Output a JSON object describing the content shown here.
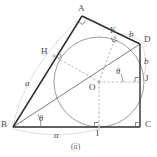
{
  "figure": {
    "caption": "(ii)",
    "colors": {
      "outline_dark": "#2b2b2b",
      "line_medium": "#6b6b6b",
      "line_light": "#9a9a9a",
      "dashed": "#8c8c8c",
      "dotted": "#b0b0b0",
      "circle": "#7d7d7d",
      "background": "#ffffff",
      "label": "#4a4a4a"
    },
    "points": [
      {
        "name": "A",
        "label": "A",
        "x": 82,
        "y": 16,
        "lx": 78,
        "ly": 8
      },
      {
        "name": "B",
        "label": "B",
        "x": 13,
        "y": 127,
        "lx": 2,
        "ly": 122
      },
      {
        "name": "C",
        "label": "C",
        "x": 140,
        "y": 127,
        "lx": 145,
        "ly": 122
      },
      {
        "name": "D",
        "label": "D",
        "x": 140,
        "y": 44,
        "lx": 145,
        "ly": 38
      },
      {
        "name": "H",
        "label": "H",
        "x": 54,
        "y": 56,
        "lx": 41,
        "ly": 50
      },
      {
        "name": "K",
        "label": "K",
        "x": 115,
        "y": 38,
        "lx": 112,
        "ly": 28
      },
      {
        "name": "J",
        "label": "J",
        "x": 140,
        "y": 82,
        "lx": 145,
        "ly": 77
      },
      {
        "name": "I",
        "label": "I",
        "x": 99,
        "y": 127,
        "lx": 96,
        "ly": 131
      },
      {
        "name": "O",
        "label": "O",
        "x": 99,
        "y": 82,
        "lx": 90,
        "ly": 85
      }
    ],
    "side_labels": [
      {
        "name": "side-a-left",
        "text": "a",
        "x": 27,
        "y": 84
      },
      {
        "name": "side-a-bottom",
        "text": "a",
        "x": 55,
        "y": 133
      },
      {
        "name": "side-b-top",
        "text": "b",
        "x": 131,
        "y": 33
      },
      {
        "name": "side-b-right",
        "text": "b",
        "x": 145,
        "y": 61
      }
    ],
    "angle_labels": [
      {
        "name": "angle-theta-at-b",
        "text": "θ",
        "x": 40,
        "y": 117
      },
      {
        "name": "angle-theta-at-o",
        "text": "θ",
        "x": 117,
        "y": 70
      }
    ],
    "circle": {
      "cx": 99,
      "cy": 82,
      "r": 45
    },
    "geometry": {
      "quad_outline": "82,16 140,44 140,127 13,127",
      "line_b_to_d": "13,127 140,44",
      "line_b_to_a": "13,127 82,16",
      "square_oicj": "99,82 99,127 140,127 140,82",
      "dashed_o_to_h": "99,82 54,56",
      "dashed_o_to_k": "99,82 115,38",
      "dashed_o_to_j": "99,82 140,82",
      "dashed_o_to_i": "99,82 99,127",
      "dotted_arc_left": "a-arc-B-to-A",
      "dotted_arc_bottom": "a-arc-B-to-I",
      "dotted_arc_top": "b-arc-K-to-D",
      "dotted_arc_right": "b-arc-D-to-J"
    },
    "right_angle_marks": [
      {
        "name": "right-angle-at-a",
        "x": 82,
        "y": 16
      },
      {
        "name": "right-angle-at-h",
        "x": 54,
        "y": 56
      },
      {
        "name": "right-angle-at-k",
        "x": 115,
        "y": 38
      },
      {
        "name": "right-angle-at-j",
        "x": 140,
        "y": 82
      },
      {
        "name": "right-angle-at-i",
        "x": 99,
        "y": 127
      },
      {
        "name": "right-angle-at-c",
        "x": 140,
        "y": 127
      }
    ]
  }
}
